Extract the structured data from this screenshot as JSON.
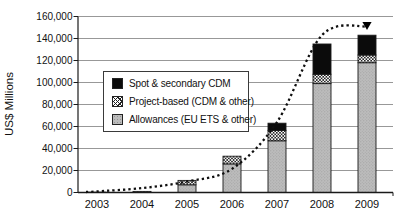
{
  "figure": {
    "ylabel": "US$ Millions",
    "legend": [
      {
        "label": "Spot & secondary CDM",
        "style": "solid-black"
      },
      {
        "label": "Project-based (CDM & other)",
        "style": "crosshatch"
      },
      {
        "label": "Allowances (EU ETS & other)",
        "style": "gray-stipple"
      }
    ]
  },
  "chart_data": {
    "type": "bar",
    "stacked": true,
    "ylabel": "US$ Millions",
    "ylim": [
      0,
      160000
    ],
    "ytick_step": 20000,
    "ytick_labels": [
      "0",
      "20,000",
      "40,000",
      "60,000",
      "80,000",
      "100,000",
      "120,000",
      "140,000",
      "160,000"
    ],
    "grid": "horizontal",
    "legend_position": "inside-upper-left",
    "categories": [
      "2003",
      "2004",
      "2005",
      "2006",
      "2007",
      "2008",
      "2009"
    ],
    "series": [
      {
        "name": "Allowances (EU ETS & other)",
        "style": "gray-stipple",
        "values": [
          0,
          0,
          7000,
          26000,
          47000,
          99000,
          118000
        ]
      },
      {
        "name": "Project-based (CDM & other)",
        "style": "crosshatch",
        "values": [
          300,
          1000,
          4000,
          7000,
          9500,
          8500,
          7000
        ]
      },
      {
        "name": "Spot & secondary CDM",
        "style": "solid-black",
        "values": [
          0,
          0,
          0,
          0,
          6500,
          27500,
          18000
        ]
      }
    ],
    "totals": [
      300,
      1000,
      11000,
      33000,
      63000,
      135000,
      143000
    ],
    "trend_line": {
      "style": "dotted",
      "end_marker": "down-triangle",
      "points": [
        [
          2003,
          1000
        ],
        [
          2004,
          4000
        ],
        [
          2005,
          10000
        ],
        [
          2006,
          21500
        ],
        [
          2007,
          64000
        ],
        [
          2008,
          143000
        ],
        [
          2009,
          151000
        ]
      ]
    }
  }
}
